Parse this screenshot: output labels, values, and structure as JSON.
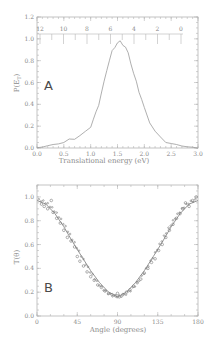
{
  "chart_data": [
    {
      "panel": "A",
      "type": "line",
      "title": "",
      "xlabel": "Translational energy (eV)",
      "ylabel": "P(E_T)",
      "xlim": [
        0.0,
        3.0
      ],
      "ylim": [
        0.0,
        1.2
      ],
      "x_ticks": [
        "0.0",
        "0.5",
        "1.0",
        "1.5",
        "2.0",
        "2.5",
        "3.0"
      ],
      "y_ticks": [
        "0.0",
        "0.2",
        "0.4",
        "0.6",
        "0.8",
        "1.0",
        "1.2"
      ],
      "secondary_x_ticks": [
        "12",
        "10",
        "8",
        "6",
        "4",
        "2",
        "0"
      ],
      "grid": false,
      "legend": null,
      "panel_label": "A",
      "x": [
        0.0,
        0.1,
        0.2,
        0.3,
        0.4,
        0.5,
        0.6,
        0.7,
        0.8,
        0.9,
        1.0,
        1.05,
        1.1,
        1.15,
        1.2,
        1.25,
        1.3,
        1.35,
        1.4,
        1.45,
        1.5,
        1.55,
        1.6,
        1.65,
        1.7,
        1.75,
        1.8,
        1.85,
        1.9,
        1.95,
        2.0,
        2.1,
        2.2,
        2.3,
        2.4,
        2.5,
        2.6,
        2.7,
        2.8,
        2.9,
        3.0
      ],
      "values": [
        0.0,
        0.01,
        0.02,
        0.03,
        0.04,
        0.05,
        0.07,
        0.09,
        0.11,
        0.14,
        0.2,
        0.26,
        0.32,
        0.4,
        0.5,
        0.6,
        0.72,
        0.8,
        0.88,
        0.93,
        0.96,
        0.97,
        0.95,
        0.92,
        0.86,
        0.78,
        0.68,
        0.6,
        0.52,
        0.44,
        0.36,
        0.24,
        0.15,
        0.09,
        0.06,
        0.04,
        0.03,
        0.02,
        0.01,
        0.005,
        0.0
      ]
    },
    {
      "panel": "B",
      "type": "scatter",
      "title": "",
      "xlabel": "Angle (degrees)",
      "ylabel": "T(θ)",
      "xlim": [
        0,
        180
      ],
      "ylim": [
        0.0,
        1.1
      ],
      "x_ticks": [
        "0",
        "45",
        "90",
        "135",
        "180"
      ],
      "y_ticks": [
        "0.0",
        "0.2",
        "0.4",
        "0.6",
        "0.8",
        "1.0"
      ],
      "grid": false,
      "legend": null,
      "panel_label": "B",
      "series": [
        {
          "name": "fit",
          "kind": "line",
          "x": [
            0,
            10,
            20,
            30,
            40,
            50,
            60,
            70,
            80,
            90,
            100,
            110,
            120,
            130,
            140,
            150,
            160,
            170,
            180
          ],
          "values": [
            0.97,
            0.94,
            0.86,
            0.75,
            0.62,
            0.5,
            0.38,
            0.28,
            0.2,
            0.16,
            0.2,
            0.28,
            0.38,
            0.5,
            0.62,
            0.75,
            0.86,
            0.94,
            0.97
          ]
        },
        {
          "name": "data",
          "kind": "scatter",
          "x": [
            5,
            8,
            12,
            16,
            18,
            22,
            26,
            30,
            34,
            38,
            42,
            45,
            48,
            52,
            56,
            60,
            64,
            68,
            72,
            76,
            80,
            84,
            88,
            90,
            92,
            96,
            100,
            104,
            108,
            112,
            116,
            120,
            124,
            128,
            132,
            136,
            140,
            144,
            148,
            152,
            156,
            160,
            163,
            166,
            170,
            174,
            178
          ],
          "values": [
            0.94,
            0.92,
            0.9,
            0.97,
            0.87,
            0.82,
            0.78,
            0.72,
            0.66,
            0.63,
            0.58,
            0.5,
            0.46,
            0.42,
            0.37,
            0.33,
            0.3,
            0.26,
            0.24,
            0.21,
            0.19,
            0.18,
            0.17,
            0.19,
            0.16,
            0.18,
            0.2,
            0.22,
            0.25,
            0.28,
            0.31,
            0.36,
            0.4,
            0.45,
            0.48,
            0.55,
            0.6,
            0.66,
            0.72,
            0.77,
            0.82,
            0.86,
            0.9,
            0.95,
            0.92,
            0.97,
            1.0
          ]
        }
      ]
    }
  ],
  "labels": {
    "a": {
      "panel_letter": "A",
      "ylabel": "P(E",
      "ylabel_sub": "T",
      "ylabel_close": ")",
      "xlabel": "Translational energy (eV)"
    },
    "b": {
      "panel_letter": "B",
      "ylabel": "T(θ)",
      "xlabel": "Angle (degrees)"
    }
  }
}
